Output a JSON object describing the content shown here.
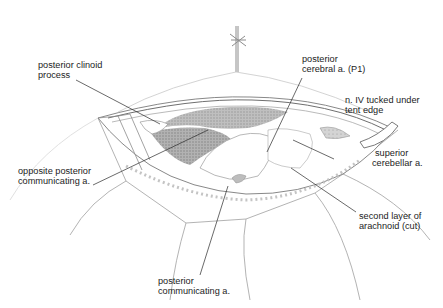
{
  "figure": {
    "type": "surgical-anatomical-illustration",
    "colors": {
      "background": "#ffffff",
      "ink": "#1c1c1c",
      "line_light": "#b8b8b8",
      "line_mid": "#7a7a7a",
      "shade_dark": "#8a8a8a",
      "shade_mid": "#bdbdbd"
    }
  },
  "labels": [
    {
      "id": "posterior-clinoid-process",
      "line1": "posterior clinoid",
      "line2": "process"
    },
    {
      "id": "posterior-cerebral-a-p1",
      "line1": "posterior",
      "line2": "cerebral a. (P1)"
    },
    {
      "id": "n-iv-tucked",
      "line1": "n. IV tucked under",
      "line2": "tent edge"
    },
    {
      "id": "superior-cerebellar-a",
      "line1": "superior",
      "line2": "cerebellar a."
    },
    {
      "id": "opposite-posterior-communicating-a",
      "line1": "opposite posterior",
      "line2": "communicating a."
    },
    {
      "id": "second-layer-arachnoid",
      "line1": "second layer of",
      "line2": "arachnoid (cut)"
    },
    {
      "id": "posterior-communicating-a",
      "line1": "posterior",
      "line2": "communicating a."
    }
  ]
}
